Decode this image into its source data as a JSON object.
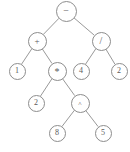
{
  "figure": {
    "kind": "binary-expression-tree",
    "background_color": "#ffffff",
    "stroke_color": "#8d8d8d",
    "text_color": "#5a5a5a",
    "width": 130,
    "height": 152
  },
  "nodes": [
    {
      "id": "n0",
      "label": "−",
      "kind": "operator",
      "glyph": "minus",
      "x": 66,
      "y": 11,
      "r": 10.5
    },
    {
      "id": "n1",
      "label": "+",
      "kind": "operator",
      "glyph": "plus",
      "x": 37,
      "y": 41,
      "r": 9.5
    },
    {
      "id": "n2",
      "label": "/",
      "kind": "operator",
      "glyph": "slash",
      "x": 101,
      "y": 41,
      "r": 9.5
    },
    {
      "id": "n3",
      "label": "1",
      "kind": "leaf",
      "glyph": "digit",
      "x": 17,
      "y": 71,
      "r": 8.5
    },
    {
      "id": "n4",
      "label": "*",
      "kind": "operator",
      "glyph": "star",
      "x": 57,
      "y": 71,
      "r": 9.5
    },
    {
      "id": "n5",
      "label": "4",
      "kind": "leaf",
      "glyph": "digit",
      "x": 81,
      "y": 71,
      "r": 8.5
    },
    {
      "id": "n6",
      "label": "2",
      "kind": "leaf",
      "glyph": "digit",
      "x": 119,
      "y": 71,
      "r": 8.5
    },
    {
      "id": "n7",
      "label": "2",
      "kind": "leaf",
      "glyph": "digit",
      "x": 36,
      "y": 103,
      "r": 8.5
    },
    {
      "id": "n8",
      "label": "^",
      "kind": "operator",
      "glyph": "caret",
      "x": 80,
      "y": 103,
      "r": 9.5
    },
    {
      "id": "n9",
      "label": "8",
      "kind": "leaf",
      "glyph": "digit",
      "x": 57,
      "y": 133,
      "r": 8.5
    },
    {
      "id": "n10",
      "label": "5",
      "kind": "leaf",
      "glyph": "digit",
      "x": 103,
      "y": 133,
      "r": 8.5
    }
  ],
  "edges": [
    {
      "from": "n0",
      "to": "n1"
    },
    {
      "from": "n0",
      "to": "n2"
    },
    {
      "from": "n1",
      "to": "n3"
    },
    {
      "from": "n1",
      "to": "n4"
    },
    {
      "from": "n2",
      "to": "n5"
    },
    {
      "from": "n2",
      "to": "n6"
    },
    {
      "from": "n4",
      "to": "n7"
    },
    {
      "from": "n4",
      "to": "n8"
    },
    {
      "from": "n8",
      "to": "n9"
    },
    {
      "from": "n8",
      "to": "n10"
    }
  ]
}
